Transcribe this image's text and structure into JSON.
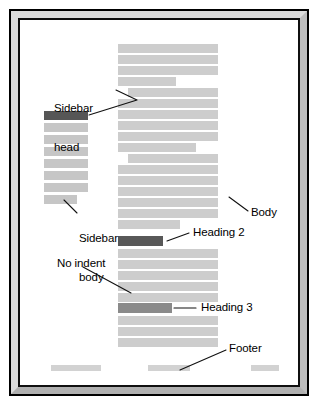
{
  "figure": {
    "type": "page-layout-diagram",
    "frame": {
      "outer_border_color": "#000000",
      "bevel_light_color": "#dcdcdc",
      "bevel_dark_color": "#b0b0b0",
      "inner_rule_color": "#101010",
      "page_color": "#ffffff"
    },
    "colors": {
      "body_text_bar": "#cdcdcd",
      "sidebar_text_bar": "#c6c6c6",
      "sidebar_head_bar": "#565656",
      "heading2_bar": "#585858",
      "heading3_bar": "#8a8a8a",
      "footer_bar": "#d2d2d2"
    }
  },
  "annotations": [
    {
      "id": "sidebar-head",
      "text_line1": "Sidebar",
      "text_line2": "head",
      "x": 34,
      "y": 59
    },
    {
      "id": "sidebar-body",
      "text_line1": "Sidebar",
      "text_line2": "body",
      "x": 46,
      "y": 172
    },
    {
      "id": "body",
      "text_line1": "Body",
      "text_line2": "",
      "x": 212,
      "y": 196
    },
    {
      "id": "heading-2",
      "text_line1": "Heading 2",
      "text_line2": "",
      "x": 172,
      "y": 211
    },
    {
      "id": "no-indent",
      "text_line1": "No indent",
      "text_line2": "",
      "x": 38,
      "y": 234
    },
    {
      "id": "heading-3",
      "text_line1": "Heading 3",
      "text_line2": "",
      "x": 180,
      "y": 279
    },
    {
      "id": "footer",
      "text_line1": "Footer",
      "text_line2": "",
      "x": 200,
      "y": 325
    }
  ],
  "sidebar": {
    "column_label": "Sidebar column",
    "head_bar": {
      "x": 24,
      "y": 91,
      "w": 44,
      "h": 9
    },
    "body_bars": [
      {
        "x": 24,
        "y": 103,
        "w": 44,
        "h": 9
      },
      {
        "x": 24,
        "y": 115,
        "w": 44,
        "h": 9
      },
      {
        "x": 24,
        "y": 127,
        "w": 44,
        "h": 9
      },
      {
        "x": 24,
        "y": 139,
        "w": 44,
        "h": 9
      },
      {
        "x": 24,
        "y": 151,
        "w": 44,
        "h": 9
      },
      {
        "x": 24,
        "y": 163,
        "w": 44,
        "h": 9
      },
      {
        "x": 24,
        "y": 175,
        "w": 33,
        "h": 9
      }
    ]
  },
  "main_column": {
    "column_label": "Body column",
    "bars": [
      {
        "x": 98,
        "y": 24,
        "w": 100,
        "h": 9,
        "kind": "body"
      },
      {
        "x": 98,
        "y": 35,
        "w": 100,
        "h": 9,
        "kind": "body"
      },
      {
        "x": 98,
        "y": 46,
        "w": 100,
        "h": 9,
        "kind": "body"
      },
      {
        "x": 98,
        "y": 57,
        "w": 58,
        "h": 9,
        "kind": "body"
      },
      {
        "x": 108,
        "y": 68,
        "w": 90,
        "h": 9,
        "kind": "body"
      },
      {
        "x": 98,
        "y": 79,
        "w": 100,
        "h": 9,
        "kind": "body"
      },
      {
        "x": 98,
        "y": 90,
        "w": 100,
        "h": 9,
        "kind": "body"
      },
      {
        "x": 98,
        "y": 101,
        "w": 100,
        "h": 9,
        "kind": "body"
      },
      {
        "x": 98,
        "y": 112,
        "w": 100,
        "h": 9,
        "kind": "body"
      },
      {
        "x": 98,
        "y": 123,
        "w": 78,
        "h": 9,
        "kind": "body"
      },
      {
        "x": 108,
        "y": 134,
        "w": 90,
        "h": 9,
        "kind": "body"
      },
      {
        "x": 98,
        "y": 145,
        "w": 100,
        "h": 9,
        "kind": "body"
      },
      {
        "x": 98,
        "y": 156,
        "w": 100,
        "h": 9,
        "kind": "body"
      },
      {
        "x": 98,
        "y": 167,
        "w": 100,
        "h": 9,
        "kind": "body"
      },
      {
        "x": 98,
        "y": 178,
        "w": 100,
        "h": 9,
        "kind": "body"
      },
      {
        "x": 98,
        "y": 189,
        "w": 100,
        "h": 9,
        "kind": "body"
      },
      {
        "x": 98,
        "y": 200,
        "w": 62,
        "h": 9,
        "kind": "body"
      },
      {
        "x": 98,
        "y": 216,
        "w": 45,
        "h": 10,
        "kind": "h2"
      },
      {
        "x": 98,
        "y": 229,
        "w": 100,
        "h": 9,
        "kind": "body"
      },
      {
        "x": 98,
        "y": 240,
        "w": 100,
        "h": 9,
        "kind": "body"
      },
      {
        "x": 98,
        "y": 251,
        "w": 100,
        "h": 9,
        "kind": "body"
      },
      {
        "x": 98,
        "y": 262,
        "w": 100,
        "h": 9,
        "kind": "body"
      },
      {
        "x": 98,
        "y": 273,
        "w": 100,
        "h": 9,
        "kind": "body"
      },
      {
        "x": 98,
        "y": 283,
        "w": 54,
        "h": 10,
        "kind": "h3"
      },
      {
        "x": 98,
        "y": 296,
        "w": 100,
        "h": 9,
        "kind": "body"
      },
      {
        "x": 98,
        "y": 307,
        "w": 100,
        "h": 9,
        "kind": "body"
      },
      {
        "x": 98,
        "y": 318,
        "w": 100,
        "h": 9,
        "kind": "body"
      }
    ]
  },
  "footer": {
    "bars": [
      {
        "x": 31,
        "y": 345,
        "w": 50,
        "h": 6
      },
      {
        "x": 128,
        "y": 345,
        "w": 42,
        "h": 6
      },
      {
        "x": 231,
        "y": 345,
        "w": 28,
        "h": 6
      }
    ]
  },
  "leaders": [
    {
      "id": "leader-sidebar-head",
      "points": "98,71 118,80 69,95"
    },
    {
      "id": "leader-sidebar-body",
      "points": "44,180 56,192"
    },
    {
      "id": "leader-body",
      "points": "226,192 210,178"
    },
    {
      "id": "leader-heading-2",
      "points": "168,214 146,221"
    },
    {
      "id": "leader-no-indent",
      "points": "62,246 110,272"
    },
    {
      "id": "leader-heading-3",
      "points": "176,288 154,288"
    },
    {
      "id": "leader-footer",
      "points": "204,330 160,349"
    }
  ]
}
